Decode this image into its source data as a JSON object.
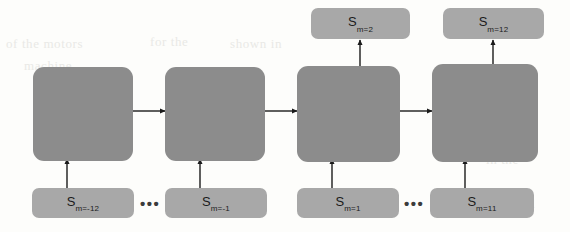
{
  "diagram": {
    "type": "recurrent-unrolled-network",
    "background_color": "#fdfdfb",
    "cell_color": "#8c8c8c",
    "state_color": "#a8a8a8",
    "arrow_color": "#1a1a1a",
    "cells": [
      {
        "name": "cell-1"
      },
      {
        "name": "cell-2"
      },
      {
        "name": "cell-3"
      },
      {
        "name": "cell-4"
      }
    ],
    "inputs": [
      {
        "base": "S",
        "sub": "m=-12"
      },
      {
        "base": "S",
        "sub": "m=-1"
      },
      {
        "base": "S",
        "sub": "m=1"
      },
      {
        "base": "S",
        "sub": "m=11"
      }
    ],
    "outputs": [
      {
        "base": "S",
        "sub": "m=2"
      },
      {
        "base": "S",
        "sub": "m=12"
      }
    ],
    "ellipses": [
      {
        "text": "•••"
      },
      {
        "text": "•••"
      }
    ],
    "bleed_text": [
      {
        "text": "of the motors"
      },
      {
        "text": "for the"
      },
      {
        "text": "shown in"
      },
      {
        "text": "machine"
      },
      {
        "text": "in the"
      },
      {
        "text": "model"
      }
    ]
  }
}
